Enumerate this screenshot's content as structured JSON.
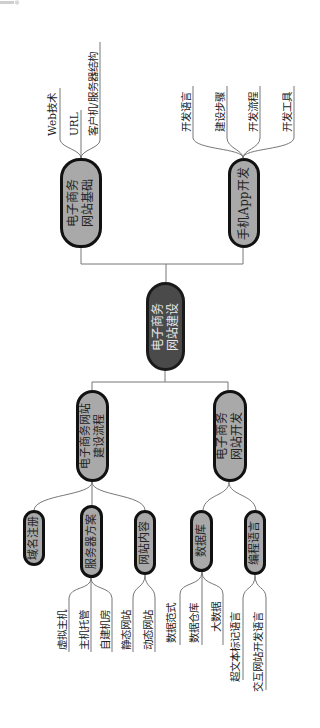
{
  "root": {
    "label_line1": "电子商务",
    "label_line2": "网站建设"
  },
  "branches": [
    {
      "id": "foundation",
      "label_line1": "电子商务",
      "label_line2": "网站基础",
      "children": [
        "Web技术",
        "URL",
        "客户机/服务器结构"
      ]
    },
    {
      "id": "app",
      "label_line1": "手机App开发",
      "label_line2": "",
      "children": [
        "开发语言",
        "建设步骤",
        "开发流程",
        "开发工具"
      ]
    },
    {
      "id": "process",
      "label_line1": "电子商务网站",
      "label_line2": "建设流程",
      "children": [
        {
          "label": "域名注册",
          "children": []
        },
        {
          "label": "服务器方案",
          "children": [
            "虚拟主机",
            "主机托管",
            "自建机房"
          ]
        },
        {
          "label": "网站内容",
          "children": [
            "静态网站",
            "动态网站"
          ]
        }
      ]
    },
    {
      "id": "dev",
      "label_line1": "电子商务",
      "label_line2": "网站开发",
      "children": [
        {
          "label": "数据库",
          "children": [
            "数据范式",
            "数据仓库",
            "大数据"
          ]
        },
        {
          "label": "编程语言",
          "children": [
            "超文本标记语言",
            "交互网站开发语言"
          ]
        }
      ]
    }
  ],
  "colors": {
    "node_fill": "#a9a9a9",
    "root_fill": "#4a4a4a",
    "border": "#111111",
    "line": "#777777"
  }
}
